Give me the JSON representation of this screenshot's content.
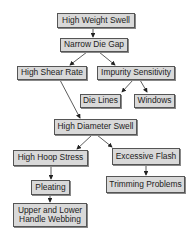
{
  "diagram": {
    "type": "flowchart",
    "nodes": [
      {
        "id": "high_weight_swell",
        "label": "High Weight Swell"
      },
      {
        "id": "narrow_die_gap",
        "label": "Narrow Die Gap"
      },
      {
        "id": "high_shear_rate",
        "label": "High Shear Rate"
      },
      {
        "id": "impurity_sensitivity",
        "label": "Impurity Sensitivity"
      },
      {
        "id": "die_lines",
        "label": "Die Lines"
      },
      {
        "id": "windows",
        "label": "Windows"
      },
      {
        "id": "high_diameter_swell",
        "label": "High Diameter Swell"
      },
      {
        "id": "high_hoop_stress",
        "label": "High Hoop Stress"
      },
      {
        "id": "excessive_flash",
        "label": "Excessive Flash"
      },
      {
        "id": "pleating",
        "label": "Pleating"
      },
      {
        "id": "trimming_problems",
        "label": "Trimming Problems"
      },
      {
        "id": "handle_webbing",
        "label": "Upper and Lower\nHandle Webbing"
      }
    ],
    "edges": [
      {
        "from": "high_weight_swell",
        "to": "narrow_die_gap"
      },
      {
        "from": "narrow_die_gap",
        "to": "high_shear_rate"
      },
      {
        "from": "narrow_die_gap",
        "to": "impurity_sensitivity"
      },
      {
        "from": "impurity_sensitivity",
        "to": "die_lines"
      },
      {
        "from": "impurity_sensitivity",
        "to": "windows"
      },
      {
        "from": "high_shear_rate",
        "to": "high_diameter_swell"
      },
      {
        "from": "high_diameter_swell",
        "to": "high_hoop_stress"
      },
      {
        "from": "high_diameter_swell",
        "to": "excessive_flash"
      },
      {
        "from": "high_hoop_stress",
        "to": "pleating"
      },
      {
        "from": "pleating",
        "to": "handle_webbing"
      },
      {
        "from": "excessive_flash",
        "to": "trimming_problems"
      }
    ],
    "colors": {
      "node_fill": "#d9d9d9",
      "node_border": "#555555",
      "edge": "#333333",
      "background": "#ffffff"
    }
  }
}
